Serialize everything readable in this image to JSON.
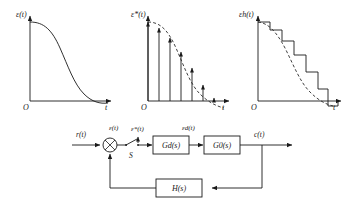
{
  "figure": {
    "line_color": "#1a1a1a",
    "dash_color": "#2a2a2a",
    "background": "#ffffff"
  },
  "charts": [
    {
      "id": "chart-continuous-error",
      "ylabel": "ε(t)",
      "xlabel": "t",
      "origin_label": "O",
      "type": "line",
      "description": "Continuous error signal decaying S-curve crossing axis near end",
      "x": [
        0,
        0.08,
        0.18,
        0.28,
        0.38,
        0.48,
        0.58,
        0.68,
        0.78,
        0.88,
        0.96,
        1.0
      ],
      "y": [
        1.0,
        0.99,
        0.95,
        0.87,
        0.73,
        0.56,
        0.38,
        0.22,
        0.1,
        0.02,
        -0.03,
        -0.04
      ],
      "ylim": [
        -0.12,
        1.08
      ],
      "xlim": [
        0,
        1.0
      ],
      "grid": false
    },
    {
      "id": "chart-sampled-error",
      "ylabel": "ε*(t)",
      "xlabel": "t",
      "origin_label": "O",
      "type": "bar",
      "description": "Impulse train samples with arrowheads under dashed envelope of the continuous error",
      "categories": [
        "0T",
        "1T",
        "2T",
        "3T",
        "4T",
        "5T",
        "6T"
      ],
      "x": [
        0.0,
        0.13,
        0.26,
        0.39,
        0.52,
        0.65,
        0.78
      ],
      "values": [
        1.0,
        0.93,
        0.8,
        0.62,
        0.42,
        0.2,
        0.03
      ],
      "envelope_x": [
        0,
        0.08,
        0.18,
        0.28,
        0.38,
        0.48,
        0.58,
        0.68,
        0.78,
        0.88,
        0.96,
        1.0
      ],
      "envelope_y": [
        1.0,
        0.99,
        0.95,
        0.87,
        0.73,
        0.56,
        0.38,
        0.22,
        0.1,
        0.02,
        -0.05,
        -0.07
      ],
      "ylim": [
        -0.14,
        1.08
      ],
      "xlim": [
        0,
        1.0
      ],
      "grid": false
    },
    {
      "id": "chart-held-error",
      "ylabel": "εh(t)",
      "xlabel": "t",
      "origin_label": "O",
      "type": "bar",
      "description": "Zero-order-hold staircase reconstruction, last step negative below axis, dashed envelope overlaid",
      "categories": [
        "0T",
        "1T",
        "2T",
        "3T",
        "4T",
        "5T",
        "6T"
      ],
      "x": [
        0.0,
        0.14,
        0.28,
        0.42,
        0.56,
        0.7,
        0.84
      ],
      "values": [
        1.0,
        0.9,
        0.76,
        0.58,
        0.37,
        0.15,
        -0.06
      ],
      "envelope_x": [
        0,
        0.09,
        0.2,
        0.31,
        0.42,
        0.53,
        0.64,
        0.75,
        0.86,
        0.94,
        1.0
      ],
      "envelope_y": [
        1.0,
        0.97,
        0.9,
        0.78,
        0.62,
        0.44,
        0.26,
        0.1,
        -0.02,
        -0.06,
        -0.07
      ],
      "ylim": [
        -0.18,
        1.08
      ],
      "xlim": [
        0,
        1.0
      ],
      "grid": false
    }
  ],
  "block_diagram": {
    "input_label": "r(t)",
    "output_label": "c(t)",
    "summing_junction": "⊗",
    "sampler_label": "S",
    "signals": {
      "error": "ε(t)",
      "sampled_error": "ε*(t)",
      "digital_error": "εd(t)"
    },
    "blocks": [
      {
        "id": "block-gd",
        "label": "Gd(s)"
      },
      {
        "id": "block-g0",
        "label": "G0(s)"
      },
      {
        "id": "block-h",
        "label": "H(s)"
      }
    ]
  }
}
